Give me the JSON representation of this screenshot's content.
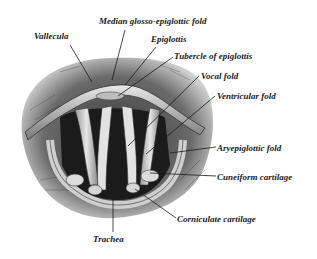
{
  "figure": {
    "labels": [
      {
        "id": "median-glosso-epiglottic-fold",
        "text": "Median glosso-epiglottic fold",
        "x": 99,
        "y": 16
      },
      {
        "id": "vallecula",
        "text": "Vallecula",
        "x": 34,
        "y": 31
      },
      {
        "id": "epiglottis",
        "text": "Epiglottis",
        "x": 151,
        "y": 34
      },
      {
        "id": "tubercle-of-epiglottis",
        "text": "Tubercle of epiglottis",
        "x": 174,
        "y": 51
      },
      {
        "id": "vocal-fold",
        "text": "Vocal fold",
        "x": 201,
        "y": 71
      },
      {
        "id": "ventricular-fold",
        "text": "Ventricular fold",
        "x": 217,
        "y": 91
      },
      {
        "id": "aryepiglottic-fold",
        "text": "Aryepiglottic fold",
        "x": 217,
        "y": 143
      },
      {
        "id": "cuneiform-cartilage",
        "text": "Cuneiform cartilage",
        "x": 217,
        "y": 172
      },
      {
        "id": "corniculate-cartilage",
        "text": "Corniculate cartilage",
        "x": 177,
        "y": 214
      },
      {
        "id": "trachea",
        "text": "Trachea",
        "x": 93,
        "y": 234
      }
    ],
    "colors": {
      "ink": "#1a1a1a",
      "shadow": "#2b2b2b",
      "mid": "#8a8a8a",
      "light": "#d9d9d9",
      "paper": "#ffffff"
    }
  }
}
